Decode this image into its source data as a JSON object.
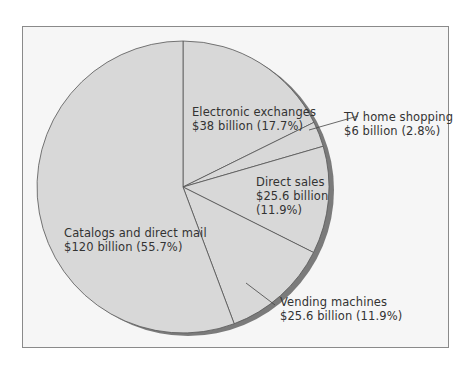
{
  "chart_data": {
    "type": "pie",
    "title": "",
    "unit": "billion USD",
    "start_angle_deg": -90,
    "direction": "clockwise",
    "slices": [
      {
        "label": "Electronic exchanges",
        "value": 38,
        "value_text": "$38 billion",
        "percent": 17.7,
        "percent_text": "(17.7%)"
      },
      {
        "label": "TV home shopping",
        "value": 6,
        "value_text": "$6 billion",
        "percent": 2.8,
        "percent_text": "(2.8%)"
      },
      {
        "label": "Direct sales",
        "value": 25.6,
        "value_text": "$25.6 billion",
        "percent": 11.9,
        "percent_text": "(11.9%)"
      },
      {
        "label": "Vending machines",
        "value": 25.6,
        "value_text": "$25.6 billion",
        "percent": 11.9,
        "percent_text": "(11.9%)"
      },
      {
        "label": "Catalogs and direct mail",
        "value": 120,
        "value_text": "$120 billion",
        "percent": 55.7,
        "percent_text": "(55.7%)"
      }
    ],
    "colors": {
      "fill": "#d8d8d8",
      "stroke": "#555555",
      "shadow": "#7b7b7b",
      "background": "#f6f6f6",
      "frame": "#8a8a8a"
    }
  },
  "labels": {
    "electronic": {
      "line1": "Electronic exchanges",
      "line2": "$38 billion (17.7%)"
    },
    "tv": {
      "line1": "TV home shopping",
      "line2": "$6 billion (2.8%)"
    },
    "direct": {
      "line1": "Direct sales",
      "line2": "$25.6 billion",
      "line3": "(11.9%)"
    },
    "vending": {
      "line1": "Vending machines",
      "line2": "$25.6 billion (11.9%)"
    },
    "catalogs": {
      "line1": "Catalogs and direct mail",
      "line2": "$120 billion (55.7%)"
    }
  }
}
